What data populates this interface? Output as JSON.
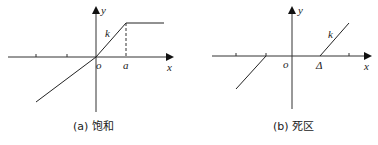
{
  "panels": [
    {
      "id": "a",
      "caption": "(a) 饱和",
      "axis_labels": {
        "x": "x",
        "y": "y",
        "origin": "o"
      },
      "slope_label": "k",
      "breakpoint_label": "a",
      "description": "Saturation nonlinearity: linear with slope k through origin, flat for x > a"
    },
    {
      "id": "b",
      "caption": "(b) 死区",
      "axis_labels": {
        "x": "x",
        "y": "y",
        "origin": "o"
      },
      "slope_label": "k",
      "breakpoint_label": "Δ",
      "description": "Dead-zone nonlinearity: zero output for |x| < Δ, slope k outside"
    }
  ],
  "figure_caption": ""
}
